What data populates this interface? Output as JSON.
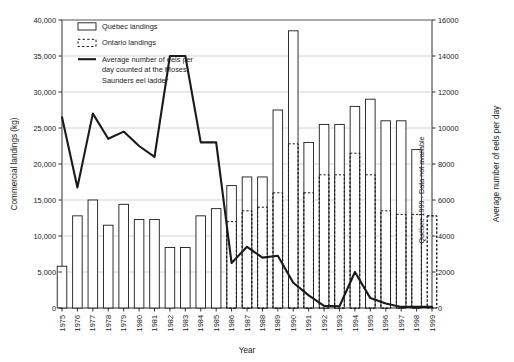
{
  "chart_data": {
    "type": "bar",
    "title": "",
    "xlabel": "Year",
    "ylabel": "Commercial landings (kg)",
    "y2label": "Average number of eels per day",
    "ylim": [
      0,
      40000
    ],
    "y2lim": [
      0,
      16000
    ],
    "yticks": [
      "0",
      "5,000",
      "10,000",
      "15,000",
      "20,000",
      "25,000",
      "30,000",
      "35,000",
      "40,000"
    ],
    "ytick_values": [
      0,
      5000,
      10000,
      15000,
      20000,
      25000,
      30000,
      35000,
      40000
    ],
    "y2ticks": [
      "0",
      "2000",
      "4000",
      "6000",
      "8000",
      "10000",
      "12000",
      "14000",
      "16000"
    ],
    "y2tick_values": [
      0,
      2000,
      4000,
      6000,
      8000,
      10000,
      12000,
      14000,
      16000
    ],
    "grid": true,
    "legend_position": "top-left",
    "categories": [
      "1975",
      "1976",
      "1977",
      "1978",
      "1979",
      "1980",
      "1981",
      "1982",
      "1983",
      "1984",
      "1985",
      "1986",
      "1987",
      "1988",
      "1989",
      "1990",
      "1991",
      "1992",
      "1993",
      "1994",
      "1995",
      "1996",
      "1997",
      "1998",
      "1999"
    ],
    "series": [
      {
        "name": "Quebec landings",
        "style": "outline-solid",
        "values": [
          5800,
          12800,
          15000,
          11500,
          14400,
          12300,
          12300,
          8400,
          8400,
          12800,
          13800,
          17000,
          18200,
          18200,
          27500,
          38500,
          23000,
          25500,
          25500,
          28000,
          29000,
          26000,
          26000,
          22000,
          null
        ]
      },
      {
        "name": "Ontario landings",
        "style": "outline-dashed",
        "values": [
          null,
          null,
          null,
          null,
          null,
          null,
          null,
          null,
          null,
          null,
          null,
          12000,
          13500,
          14000,
          16000,
          22800,
          16000,
          18500,
          18500,
          21500,
          18500,
          13500,
          13000,
          13000,
          12800
        ]
      }
    ],
    "line_series": {
      "name": "Average number of eels per day counted at the Moses-Saunders eel ladder",
      "axis": "right",
      "values": [
        10600,
        6700,
        10800,
        9400,
        9800,
        9000,
        8400,
        14000,
        14000,
        9200,
        9200,
        2500,
        3400,
        2800,
        2900,
        1400,
        700,
        120,
        100,
        2000,
        550,
        250,
        60,
        60,
        60
      ]
    },
    "annotations": [
      {
        "text": "Québec 1999 - Data not available",
        "orientation": "vertical",
        "position": "right-inside"
      }
    ]
  },
  "legend": {
    "items": [
      {
        "label": "Québec landings",
        "marker": "box-solid"
      },
      {
        "label": "Ontario landings",
        "marker": "box-dashed"
      },
      {
        "label": "Average number of eels per",
        "marker": "line"
      },
      {
        "label": "day counted at the Moses-",
        "marker": "none"
      },
      {
        "label": "Saunders eel ladder",
        "marker": "none"
      }
    ]
  },
  "colors": {
    "stroke": "#1a1a1a",
    "grid": "#c9c9c9",
    "background": "#ffffff"
  }
}
